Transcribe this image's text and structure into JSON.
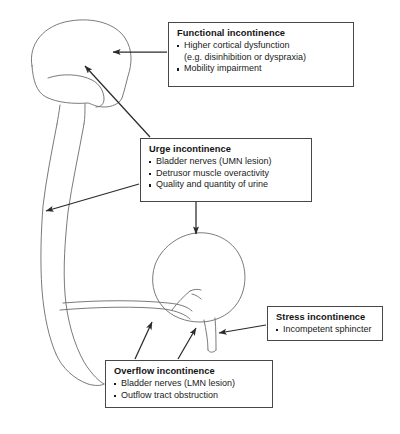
{
  "diagram": {
    "type": "anatomical-flow-diagram",
    "background_color": "#ffffff",
    "line_color": "#6b6b6b",
    "arrow_color": "#2b2b2b",
    "box_border_color": "#45474a",
    "text_color": "#131313"
  },
  "anatomy": {
    "parts": [
      {
        "name": "brain",
        "label": "brain"
      },
      {
        "name": "spinal-cord",
        "label": "spinal cord"
      },
      {
        "name": "bladder",
        "label": "bladder"
      },
      {
        "name": "urethra",
        "label": "urethra"
      },
      {
        "name": "sphincter",
        "label": "sphincter"
      },
      {
        "name": "pelvic-nerves",
        "label": "pelvic nerves"
      }
    ]
  },
  "boxes": {
    "functional": {
      "title": "Functional incontinence",
      "items": [
        "Higher cortical dysfunction",
        "(e.g. disinhibition or dyspraxia)",
        "Mobility impairment"
      ],
      "bullets": [
        true,
        false,
        true
      ]
    },
    "urge": {
      "title": "Urge incontinence",
      "items": [
        "Bladder nerves (UMN lesion)",
        "Detrusor muscle overactivity",
        "Quality and quantity of urine"
      ],
      "bullets": [
        true,
        true,
        true
      ]
    },
    "stress": {
      "title": "Stress incontinence",
      "items": [
        "Incompetent sphincter"
      ],
      "bullets": [
        true
      ]
    },
    "overflow": {
      "title": "Overflow incontinence",
      "items": [
        "Bladder nerves (LMN lesion)",
        "Outflow tract obstruction"
      ],
      "bullets": [
        true,
        true
      ]
    }
  },
  "connectors": [
    {
      "name": "functional-to-brain",
      "from": "functional",
      "to": "brain"
    },
    {
      "name": "urge-to-brain",
      "from": "urge",
      "to": "brain"
    },
    {
      "name": "urge-to-spinal-cord",
      "from": "urge",
      "to": "spinal-cord"
    },
    {
      "name": "urge-to-bladder",
      "from": "urge",
      "to": "bladder"
    },
    {
      "name": "stress-to-sphincter",
      "from": "stress",
      "to": "sphincter"
    },
    {
      "name": "overflow-to-bladder-neck",
      "from": "overflow",
      "to": "bladder-neck"
    },
    {
      "name": "overflow-to-urethra",
      "from": "overflow",
      "to": "urethra"
    }
  ]
}
